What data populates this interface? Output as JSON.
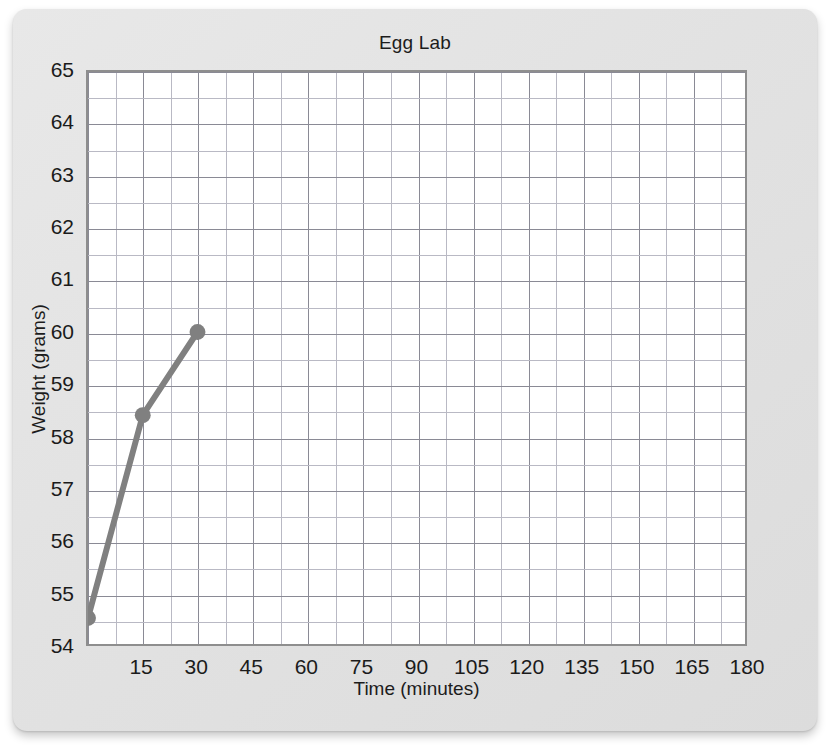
{
  "chart_data": {
    "type": "line",
    "title": "Egg Lab",
    "xlabel": "Time (minutes)",
    "ylabel": "Weight (grams)",
    "xlim": [
      0,
      180
    ],
    "ylim": [
      54,
      65
    ],
    "xticks": [
      0,
      15,
      30,
      45,
      60,
      75,
      90,
      105,
      120,
      135,
      150,
      165,
      180
    ],
    "xtick_labels": [
      "",
      "15",
      "30",
      "45",
      "60",
      "75",
      "90",
      "105",
      "120",
      "135",
      "150",
      "165",
      "180"
    ],
    "yticks": [
      54,
      55,
      56,
      57,
      58,
      59,
      60,
      61,
      62,
      63,
      64,
      65
    ],
    "ytick_labels": [
      "54",
      "55",
      "56",
      "57",
      "58",
      "59",
      "60",
      "61",
      "62",
      "63",
      "64",
      "65"
    ],
    "x_minor_step": 7.5,
    "y_minor_step": 0.5,
    "grid": true,
    "legend": "none",
    "series": [
      {
        "name": "Egg weight",
        "color": "#808080",
        "marker": "circle",
        "x": [
          0,
          15,
          30
        ],
        "values": [
          54.5,
          58.4,
          60.0
        ]
      }
    ]
  },
  "colors": {
    "panel": "#e3e3e3",
    "plot_background": "#ffffff",
    "plot_border": "#8e8e8e",
    "grid_major": "#8a8a95",
    "grid_minor": "#b9b9c4",
    "series": "#808080",
    "text": "#1b1b1b"
  }
}
